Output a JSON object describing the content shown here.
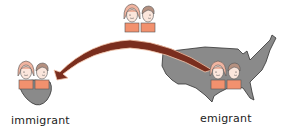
{
  "labels": {
    "immigrant": "immigrant",
    "emigrant": "emigrant"
  },
  "icons": {
    "origin_map": "usa-map-icon",
    "destination_map": "foreign-land-icon",
    "arrow": "migration-arrow-icon",
    "people": "couple-icon"
  },
  "colors": {
    "map_fill": "#8a8a8a",
    "map_stroke": "#333333",
    "arrow": "#7a2e1e",
    "arrow_edge": "#f3c4aa",
    "skin": "#fbe6dc",
    "hair_female": "#f0b4a0",
    "hair_male": "#b49080",
    "shirt": "#f2916e"
  }
}
